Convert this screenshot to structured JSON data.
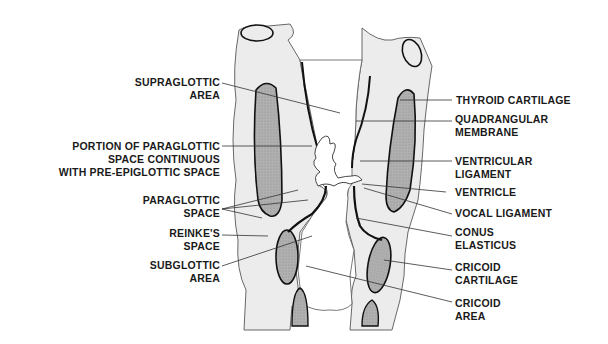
{
  "figure": {
    "colors": {
      "background": "#ffffff",
      "tissue_light": "#ececec",
      "cartilage_fill": "#a9a9a9",
      "outline": "#111111",
      "leader": "#333333"
    }
  },
  "labels_left": [
    {
      "id": "supraglottic-area",
      "lines": [
        "SUPRAGLOTTIC",
        "AREA"
      ]
    },
    {
      "id": "paraglottic-portion",
      "lines": [
        "PORTION OF PARAGLOTTIC",
        "SPACE CONTINUOUS",
        "WITH PRE-EPIGLOTTIC SPACE"
      ]
    },
    {
      "id": "paraglottic-space",
      "lines": [
        "PARAGLOTTIC",
        "SPACE"
      ]
    },
    {
      "id": "reinkes-space",
      "lines": [
        "REINKE'S",
        "SPACE"
      ]
    },
    {
      "id": "subglottic-area",
      "lines": [
        "SUBGLOTTIC",
        "AREA"
      ]
    }
  ],
  "labels_right": [
    {
      "id": "thyroid-cartilage",
      "lines": [
        "THYROID CARTILAGE"
      ]
    },
    {
      "id": "quadrangular-membrane",
      "lines": [
        "QUADRANGULAR",
        "MEMBRANE"
      ]
    },
    {
      "id": "ventricular-ligament",
      "lines": [
        "VENTRICULAR",
        "LIGAMENT"
      ]
    },
    {
      "id": "ventricle",
      "lines": [
        "VENTRICLE"
      ]
    },
    {
      "id": "vocal-ligament",
      "lines": [
        "VOCAL LIGAMENT"
      ]
    },
    {
      "id": "conus-elasticus",
      "lines": [
        "CONUS",
        "ELASTICUS"
      ]
    },
    {
      "id": "cricoid-cartilage",
      "lines": [
        "CRICOID",
        "CARTILAGE"
      ]
    },
    {
      "id": "cricoid-area",
      "lines": [
        "CRICOID",
        "AREA"
      ]
    }
  ]
}
